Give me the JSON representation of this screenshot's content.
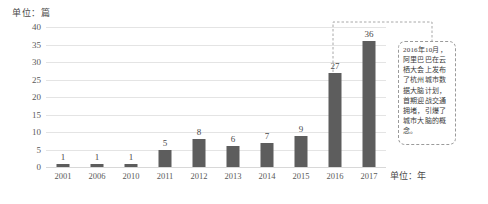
{
  "chart_data": {
    "type": "bar",
    "title": "",
    "subtitle": "",
    "xlabel": "单位：年",
    "ylabel": "单位：篇",
    "categories": [
      "2001",
      "2006",
      "2010",
      "2011",
      "2012",
      "2013",
      "2014",
      "2015",
      "2016",
      "2017"
    ],
    "values": [
      1,
      1,
      1,
      5,
      8,
      6,
      7,
      9,
      27,
      36
    ],
    "series": [
      {
        "name": "发文量",
        "values": [
          1,
          1,
          1,
          5,
          8,
          6,
          7,
          9,
          27,
          36
        ]
      }
    ],
    "ylim": [
      0,
      40
    ],
    "yticks": [
      0,
      5,
      10,
      15,
      20,
      25,
      30,
      35,
      40
    ],
    "ytick_labels": [
      "0",
      "5",
      "10",
      "15",
      "20",
      "25",
      "30",
      "35",
      "40"
    ],
    "grid": true,
    "legend": false,
    "legend_position": "none",
    "bar_color": "#5d5d5d",
    "grid_color": "#e4e4e4",
    "data_labels": [
      "1",
      "1",
      "1",
      "5",
      "8",
      "6",
      "7",
      "9",
      "27",
      "36"
    ],
    "annotations": [
      {
        "target_category": "2016",
        "text": "2016年10月，阿里巴巴在云栖大会上发布了杭州城市数据大脑计划，首期迎战交通拥堵，引爆了城市大脑的概念。"
      }
    ]
  },
  "labels": {
    "unit_y": "单位：篇",
    "unit_x": "单位：年"
  },
  "annotation": {
    "text": "2016年10月，阿里巴巴在云栖大会上发布了杭州城市数据大脑计划，首期迎战交通拥堵，引爆了城市大脑的概念。"
  },
  "colors": {
    "bar": "#5d5d5d",
    "grid": "#e4e4e4",
    "text": "#4a4a4a",
    "callout_border": "#9a9a9a"
  }
}
